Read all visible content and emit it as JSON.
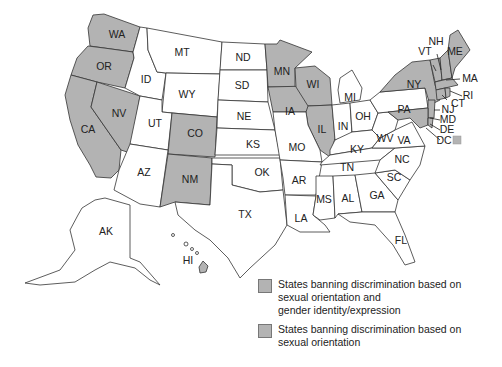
{
  "colors": {
    "shaded": "#b3b3b3",
    "unshaded": "#ffffff",
    "border": "#333333"
  },
  "map": {
    "states_shaded": [
      "WA",
      "OR",
      "CA",
      "NV",
      "CO",
      "NM",
      "MN",
      "IA",
      "WI",
      "IL",
      "NY",
      "VT",
      "NH",
      "ME",
      "MA",
      "RI",
      "CT",
      "NJ",
      "MD",
      "DE",
      "DC",
      "HI"
    ],
    "labels": {
      "WA": "WA",
      "OR": "OR",
      "CA": "CA",
      "NV": "NV",
      "ID": "ID",
      "MT": "MT",
      "WY": "WY",
      "UT": "UT",
      "AZ": "AZ",
      "CO": "CO",
      "NM": "NM",
      "ND": "ND",
      "SD": "SD",
      "NE": "NE",
      "KS": "KS",
      "OK": "OK",
      "TX": "TX",
      "MN": "MN",
      "IA": "IA",
      "MO": "MO",
      "AR": "AR",
      "LA": "LA",
      "WI": "WI",
      "IL": "IL",
      "MI": "MI",
      "IN": "IN",
      "OH": "OH",
      "KY": "KY",
      "TN": "TN",
      "MS": "MS",
      "AL": "AL",
      "GA": "GA",
      "FL": "FL",
      "SC": "SC",
      "NC": "NC",
      "VA": "VA",
      "WV": "WV",
      "PA": "PA",
      "NY": "NY",
      "VT": "VT",
      "NH": "NH",
      "ME": "ME",
      "MA": "MA",
      "RI": "RI",
      "CT": "CT",
      "NJ": "NJ",
      "MD": "MD",
      "DE": "DE",
      "DC": "DC",
      "AK": "AK",
      "HI": "HI"
    }
  },
  "legend": {
    "items": [
      {
        "label": "States banning discrimination based on\nsexual orientation and\ngender identity/expression",
        "color": "#b3b3b3"
      },
      {
        "label": "States banning discrimination based on\nsexual orientation",
        "color": "#b3b3b3"
      }
    ]
  }
}
